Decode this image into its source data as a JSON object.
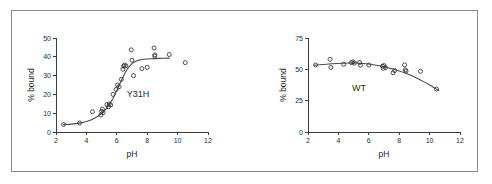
{
  "figure": {
    "background_color": "#ffffff",
    "frame_color": "#8a8a8a",
    "marker_color": "#3a3a3a",
    "curve_color": "#4a4a4a",
    "axis_color": "#3b3b3b"
  },
  "chart_data": [
    {
      "type": "scatter",
      "title": "",
      "annotation": "Y31H",
      "xlabel": "pH",
      "ylabel": "% bound",
      "xlim": [
        2,
        12
      ],
      "ylim": [
        0,
        50
      ],
      "xticks": [
        2,
        4,
        6,
        8,
        10,
        12
      ],
      "xtick_labels": [
        "2",
        "4",
        "6",
        "8",
        "10",
        "12"
      ],
      "yticks": [
        0,
        10,
        20,
        30,
        40,
        50
      ],
      "ytick_labels": [
        "0",
        "10",
        "20",
        "30",
        "40",
        "50"
      ],
      "grid": false,
      "legend": "none",
      "marker": "open-circle",
      "points": [
        {
          "x": 2.5,
          "y": 4.0
        },
        {
          "x": 3.55,
          "y": 4.8
        },
        {
          "x": 4.4,
          "y": 10.8
        },
        {
          "x": 4.95,
          "y": 9.0
        },
        {
          "x": 5.0,
          "y": 11.0
        },
        {
          "x": 5.05,
          "y": 12.2
        },
        {
          "x": 5.1,
          "y": 10.3
        },
        {
          "x": 5.35,
          "y": 14.6
        },
        {
          "x": 5.45,
          "y": 13.4
        },
        {
          "x": 5.5,
          "y": 14.9
        },
        {
          "x": 5.6,
          "y": 14.4
        },
        {
          "x": 5.75,
          "y": 20.0
        },
        {
          "x": 5.95,
          "y": 22.6
        },
        {
          "x": 6.05,
          "y": 25.0
        },
        {
          "x": 6.15,
          "y": 24.1
        },
        {
          "x": 6.3,
          "y": 28.0
        },
        {
          "x": 6.4,
          "y": 33.4
        },
        {
          "x": 6.45,
          "y": 35.0
        },
        {
          "x": 6.5,
          "y": 35.6
        },
        {
          "x": 6.6,
          "y": 35.2
        },
        {
          "x": 6.95,
          "y": 43.7
        },
        {
          "x": 7.0,
          "y": 38.2
        },
        {
          "x": 7.1,
          "y": 30.0
        },
        {
          "x": 7.65,
          "y": 33.7
        },
        {
          "x": 8.0,
          "y": 34.4
        },
        {
          "x": 8.45,
          "y": 44.7
        },
        {
          "x": 8.5,
          "y": 41.0
        },
        {
          "x": 8.5,
          "y": 40.3
        },
        {
          "x": 9.45,
          "y": 41.2
        },
        {
          "x": 10.5,
          "y": 36.9
        }
      ],
      "fit_curve": [
        {
          "x": 2.5,
          "y": 3.9
        },
        {
          "x": 3.0,
          "y": 4.2
        },
        {
          "x": 3.5,
          "y": 4.7
        },
        {
          "x": 4.0,
          "y": 5.6
        },
        {
          "x": 4.4,
          "y": 6.8
        },
        {
          "x": 4.8,
          "y": 8.6
        },
        {
          "x": 5.1,
          "y": 10.6
        },
        {
          "x": 5.4,
          "y": 13.4
        },
        {
          "x": 5.7,
          "y": 17.2
        },
        {
          "x": 5.9,
          "y": 20.3
        },
        {
          "x": 6.1,
          "y": 23.8
        },
        {
          "x": 6.3,
          "y": 27.4
        },
        {
          "x": 6.5,
          "y": 30.7
        },
        {
          "x": 6.7,
          "y": 33.5
        },
        {
          "x": 6.9,
          "y": 35.6
        },
        {
          "x": 7.1,
          "y": 37.0
        },
        {
          "x": 7.4,
          "y": 38.1
        },
        {
          "x": 7.8,
          "y": 38.7
        },
        {
          "x": 8.3,
          "y": 39.0
        },
        {
          "x": 9.0,
          "y": 39.2
        },
        {
          "x": 9.45,
          "y": 39.3
        }
      ]
    },
    {
      "type": "scatter",
      "title": "",
      "annotation": "WT",
      "xlabel": "pH",
      "ylabel": "% bound",
      "xlim": [
        2,
        12
      ],
      "ylim": [
        0,
        75
      ],
      "xticks": [
        2,
        4,
        6,
        8,
        10,
        12
      ],
      "xtick_labels": [
        "2",
        "4",
        "6",
        "8",
        "10",
        "12"
      ],
      "yticks": [
        0,
        25,
        50,
        75
      ],
      "ytick_labels": [
        "0",
        "25",
        "50",
        "75"
      ],
      "grid": false,
      "legend": "none",
      "marker": "open-circle",
      "points": [
        {
          "x": 2.5,
          "y": 53.5
        },
        {
          "x": 3.45,
          "y": 58.0
        },
        {
          "x": 3.5,
          "y": 51.5
        },
        {
          "x": 4.35,
          "y": 54.0
        },
        {
          "x": 4.85,
          "y": 55.4
        },
        {
          "x": 4.95,
          "y": 56.0
        },
        {
          "x": 5.05,
          "y": 55.0
        },
        {
          "x": 5.4,
          "y": 55.5
        },
        {
          "x": 5.45,
          "y": 53.3
        },
        {
          "x": 6.0,
          "y": 53.4
        },
        {
          "x": 6.9,
          "y": 52.5
        },
        {
          "x": 6.95,
          "y": 50.8
        },
        {
          "x": 7.0,
          "y": 53.0
        },
        {
          "x": 7.1,
          "y": 51.4
        },
        {
          "x": 7.6,
          "y": 47.3
        },
        {
          "x": 7.7,
          "y": 49.0
        },
        {
          "x": 8.35,
          "y": 53.6
        },
        {
          "x": 8.4,
          "y": 49.6
        },
        {
          "x": 8.45,
          "y": 48.6
        },
        {
          "x": 9.4,
          "y": 48.4
        },
        {
          "x": 10.45,
          "y": 34.2
        }
      ],
      "fit_curve": [
        {
          "x": 2.4,
          "y": 53.3
        },
        {
          "x": 3.0,
          "y": 53.9
        },
        {
          "x": 3.6,
          "y": 54.4
        },
        {
          "x": 4.2,
          "y": 54.8
        },
        {
          "x": 4.8,
          "y": 55.0
        },
        {
          "x": 5.2,
          "y": 55.0
        },
        {
          "x": 5.6,
          "y": 54.7
        },
        {
          "x": 6.0,
          "y": 54.2
        },
        {
          "x": 6.4,
          "y": 53.5
        },
        {
          "x": 6.8,
          "y": 52.6
        },
        {
          "x": 7.2,
          "y": 51.5
        },
        {
          "x": 7.6,
          "y": 50.2
        },
        {
          "x": 8.0,
          "y": 48.7
        },
        {
          "x": 8.4,
          "y": 47.0
        },
        {
          "x": 8.8,
          "y": 45.0
        },
        {
          "x": 9.2,
          "y": 42.7
        },
        {
          "x": 9.6,
          "y": 40.2
        },
        {
          "x": 10.0,
          "y": 37.5
        },
        {
          "x": 10.4,
          "y": 34.6
        },
        {
          "x": 10.6,
          "y": 33.1
        }
      ]
    }
  ]
}
